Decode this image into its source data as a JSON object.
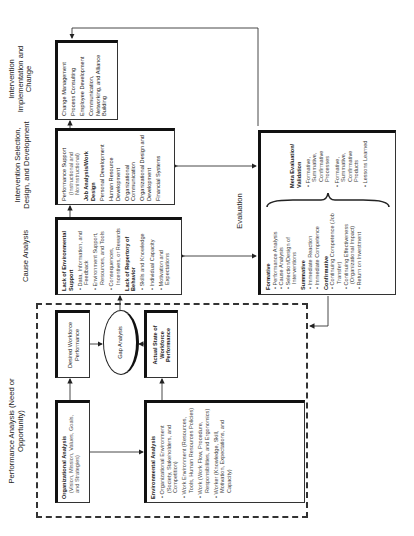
{
  "headers": {
    "performance": "Performance Analysis (Need or Opportunity)",
    "cause": "Cause Analysis",
    "selection": "Intervention Selection, Design, and Development",
    "implementation": "Intervention Implementation and Change",
    "evaluation": "Evaluation"
  },
  "org_analysis": {
    "title": "Organizational Analysis",
    "detail": "(Vision, Mission, Values, Goals, and Strategies)"
  },
  "env_analysis": {
    "title": "Environmental Analysis",
    "items": [
      "Organizational Environment (Society, Stakeholders, and Competition)",
      "Work Environment (Resources, Tools, Human Resources Policies)",
      "Work (Work Flow, Procedure, Responsibilities, and Ergonomics)",
      "Worker (Knowledge, Skill, Motivation, Expectations, and Capacity)"
    ]
  },
  "desired": "Desired Workforce Performance",
  "actual": "Actual State of Workforce Performance",
  "gap": "Gap Analysis",
  "cause_box": {
    "group1": "Lack of Environmental Support",
    "items1": [
      "Data, Information, and Feedback",
      "Environment Support, Resources, and Tools",
      "Consequences, Incentives, or Rewards"
    ],
    "group2": "Lack of Repertory of Behavior",
    "items2": [
      "Skills and Knowledge",
      "Individual Capacity",
      "Motivation and Expectations"
    ]
  },
  "selection_box": {
    "items": [
      {
        "label": "Performance Support",
        "sub": "(Instructional and Noninstructional)"
      },
      {
        "label": "Job Analysis/Work Design",
        "sub": ""
      },
      {
        "label": "Personal Development",
        "sub": ""
      },
      {
        "label": "Human Resource Development",
        "sub": ""
      },
      {
        "label": "Organizational Communication",
        "sub": ""
      },
      {
        "label": "Organizational Design and Development",
        "sub": ""
      },
      {
        "label": "Financial Systems",
        "sub": ""
      }
    ]
  },
  "implementation_box": {
    "items": [
      "Change Management",
      "Process Consulting",
      "Employee Development",
      "Communication, Networking, and Alliance Building"
    ]
  },
  "evaluation_box": {
    "formative": "Formative",
    "formative_items": [
      "Performance Analysis",
      "Cause Analysis",
      "Selection/Design of Interventions"
    ],
    "summative": "Summative",
    "summative_items": [
      "Immediate Reaction",
      "Immediate Competence"
    ],
    "confirmative": "Confirmative",
    "confirmative_items": [
      "Continuing Competence (Job Transfer)",
      "Continuing Effectiveness (Organizational Impact)",
      "Return on Investment"
    ],
    "meta": "Meta Evaluation/ Validation",
    "meta_items": [
      "Formative, Summative, Confirmative Processes",
      "Formative, Summative, Confirmative Products",
      "Lessons Learned"
    ]
  }
}
